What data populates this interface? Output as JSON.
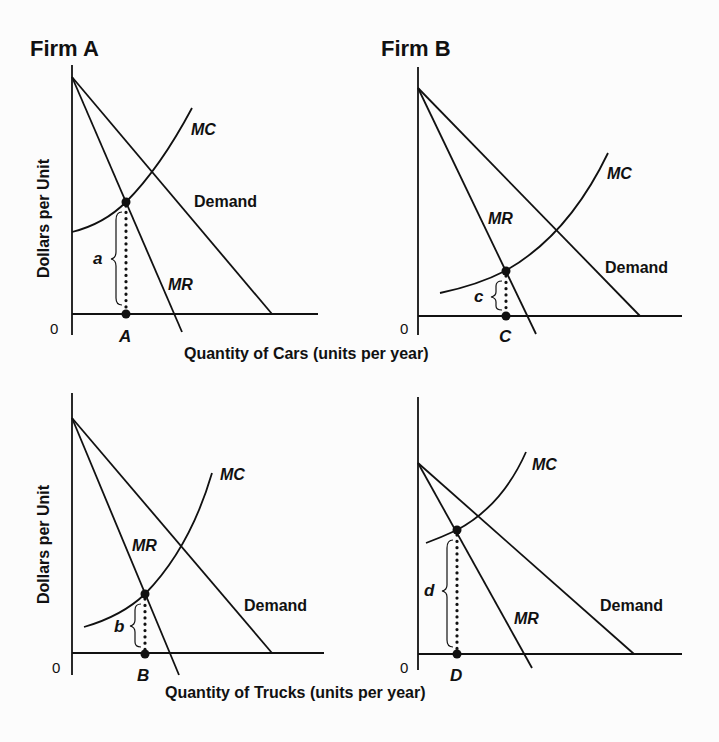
{
  "figure": {
    "panels": [
      {
        "id": "firm-a-cars",
        "title": "Firm A",
        "y_axis_label": "Dollars per Unit",
        "origin_label": "0",
        "curves": {
          "mc": "MC",
          "mr": "MR",
          "demand": "Demand"
        },
        "output_point_label": "A",
        "gap_label": "a"
      },
      {
        "id": "firm-b-cars",
        "title": "Firm B",
        "origin_label": "0",
        "curves": {
          "mc": "MC",
          "mr": "MR",
          "demand": "Demand"
        },
        "output_point_label": "C",
        "gap_label": "c"
      },
      {
        "id": "firm-a-trucks",
        "y_axis_label": "Dollars per Unit",
        "origin_label": "0",
        "curves": {
          "mc": "MC",
          "mr": "MR",
          "demand": "Demand"
        },
        "output_point_label": "B",
        "gap_label": "b"
      },
      {
        "id": "firm-b-trucks",
        "origin_label": "0",
        "curves": {
          "mc": "MC",
          "mr": "MR",
          "demand": "Demand"
        },
        "output_point_label": "D",
        "gap_label": "d"
      }
    ],
    "x_axis_labels": {
      "top_row": "Quantity of Cars (units per year)",
      "bottom_row": "Quantity of Trucks (units per year)"
    }
  },
  "colors": {
    "ink": "#111111",
    "background": "#fcfcfc"
  }
}
